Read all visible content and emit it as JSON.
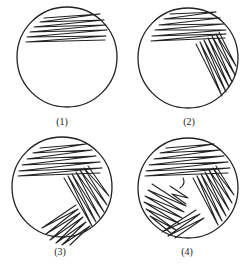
{
  "figure": {
    "panels": [
      {
        "label": "(1)",
        "stage": "first streak region"
      },
      {
        "label": "(2)",
        "stage": "second streak region"
      },
      {
        "label": "(3)",
        "stage": "third streak region"
      },
      {
        "label": "(4)",
        "stage": "fourth streak region"
      }
    ],
    "stroke_color": "#222222",
    "background": "#ffffff"
  }
}
